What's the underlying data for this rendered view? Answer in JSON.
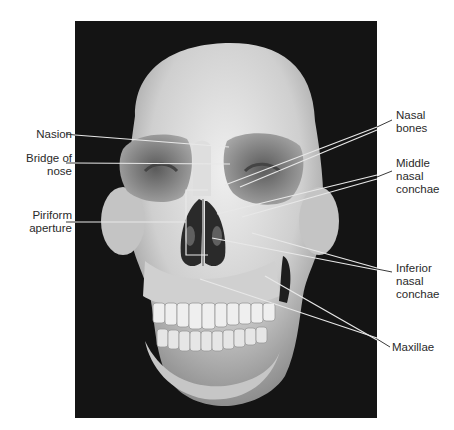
{
  "figure": {
    "background_color": "#141414",
    "bone_color": "#d9d9d9",
    "label_color": "#2a2a2a",
    "leader_line_color": "#e8e8e8"
  },
  "labels": {
    "left": [
      {
        "id": "nasion",
        "lines": [
          "Nasion"
        ]
      },
      {
        "id": "bridge",
        "lines": [
          "Bridge of",
          "nose"
        ]
      },
      {
        "id": "piriform",
        "lines": [
          "Piriform",
          "aperture"
        ]
      }
    ],
    "right": [
      {
        "id": "nasal-bones",
        "lines": [
          "Nasal",
          "bones"
        ]
      },
      {
        "id": "middle-conchae",
        "lines": [
          "Middle",
          "nasal",
          "conchae"
        ]
      },
      {
        "id": "inferior-conchae",
        "lines": [
          "Inferior",
          "nasal",
          "conchae"
        ]
      },
      {
        "id": "maxillae",
        "lines": [
          "Maxillae"
        ]
      }
    ]
  }
}
